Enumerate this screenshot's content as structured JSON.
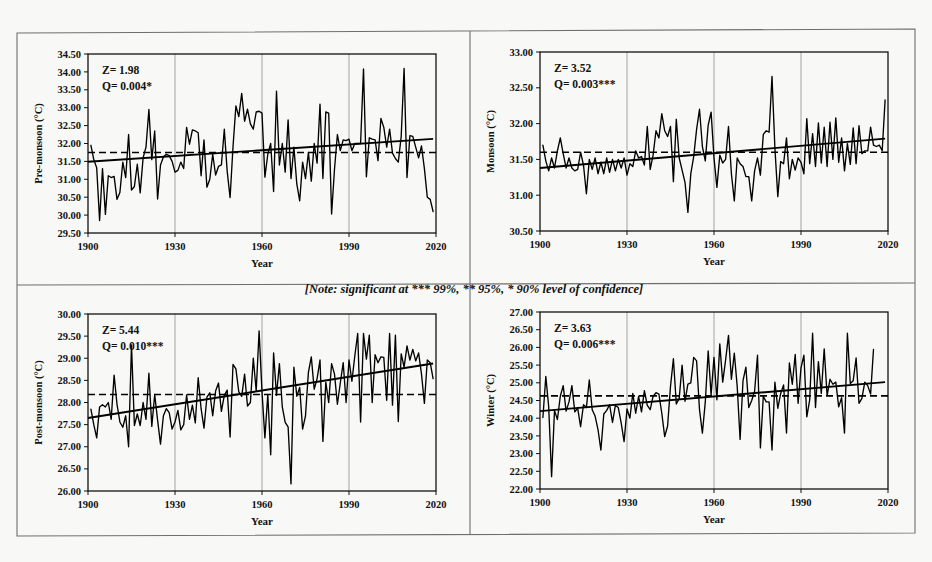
{
  "figure": {
    "note": "[Note: significant at *** 99%, ** 95%, * 90% level of confidence]",
    "background_color": "#f8f8f6",
    "line_color": "#000000",
    "grid_color": "#9a9a9a"
  },
  "chart_data": [
    {
      "id": "pre-monsoon",
      "type": "line",
      "title": "",
      "xlabel": "Year",
      "ylabel": "Pre-monsoon (°C)",
      "xlim": [
        1900,
        2020
      ],
      "ylim": [
        29.5,
        34.5
      ],
      "ytick_step": 0.5,
      "xticks": [
        1900,
        1930,
        1960,
        1990,
        2020
      ],
      "yticks": [
        "34.50",
        "34.00",
        "33.50",
        "33.00",
        "32.50",
        "32.00",
        "31.50",
        "31.00",
        "30.50",
        "30.00",
        "29.50"
      ],
      "grid": "vertical",
      "annotations": {
        "z": "Z= 1.98",
        "q": "Q= 0.004*"
      },
      "mean": 31.75,
      "trend": {
        "start_year": 1900,
        "start_value": 31.49,
        "end_year": 2019,
        "end_value": 32.13
      },
      "x_start": 1901,
      "values": [
        31.95,
        31.55,
        31.32,
        29.85,
        31.3,
        30.02,
        31.1,
        31.05,
        31.08,
        30.44,
        30.63,
        31.48,
        31.05,
        32.25,
        30.7,
        30.8,
        31.42,
        30.62,
        31.6,
        31.9,
        32.95,
        31.55,
        32.35,
        30.45,
        31.4,
        31.62,
        31.7,
        31.66,
        31.5,
        31.2,
        31.25,
        31.48,
        31.3,
        32.45,
        31.98,
        32.38,
        32.35,
        32.3,
        31.1,
        32.1,
        30.78,
        31.0,
        31.7,
        31.12,
        31.36,
        31.4,
        32.4,
        31.22,
        30.49,
        31.9,
        33.05,
        32.75,
        33.4,
        32.62,
        32.96,
        32.55,
        32.4,
        32.88,
        32.9,
        32.85,
        31.06,
        31.7,
        32.0,
        30.66,
        33.46,
        31.4,
        32.0,
        31.2,
        32.66,
        31.02,
        31.9,
        30.87,
        30.4,
        31.48,
        31.02,
        31.75,
        30.95,
        32.0,
        31.45,
        33.1,
        31.02,
        32.88,
        32.85,
        30.03,
        31.28,
        32.25,
        31.8,
        32.1,
        32.08,
        32.12,
        31.8,
        32.0,
        32.0,
        32.0,
        34.08,
        31.07,
        32.16,
        32.12,
        32.1,
        31.52,
        32.7,
        32.45,
        31.9,
        32.4,
        31.73,
        31.58,
        31.48,
        32.2,
        34.1,
        31.05,
        32.22,
        32.2,
        31.9,
        31.6,
        31.93,
        31.3,
        30.5,
        30.44,
        30.1
      ]
    },
    {
      "id": "monsoon",
      "type": "line",
      "title": "",
      "xlabel": "Year",
      "ylabel": "Monsoon (°C)",
      "xlim": [
        1900,
        2020
      ],
      "ylim": [
        30.5,
        33.0
      ],
      "ytick_step": 0.5,
      "xticks": [
        1900,
        1930,
        1960,
        1990,
        2020
      ],
      "yticks": [
        "33.00",
        "32.50",
        "32.00",
        "31.50",
        "31.00",
        "30.50"
      ],
      "grid": "vertical",
      "annotations": {
        "z": "Z= 3.52",
        "q": "Q= 0.003***"
      },
      "mean": 31.6,
      "trend": {
        "start_year": 1900,
        "start_value": 31.38,
        "end_year": 2019,
        "end_value": 31.79
      },
      "x_start": 1901,
      "values": [
        31.7,
        31.48,
        31.34,
        31.52,
        31.38,
        31.62,
        31.8,
        31.58,
        31.38,
        31.52,
        31.38,
        31.34,
        31.36,
        31.6,
        31.42,
        31.02,
        31.5,
        31.36,
        31.52,
        31.3,
        31.46,
        31.3,
        31.52,
        31.32,
        31.5,
        31.34,
        31.5,
        31.38,
        31.52,
        31.28,
        31.44,
        31.4,
        31.62,
        31.52,
        31.54,
        31.42,
        31.96,
        31.36,
        31.56,
        31.9,
        31.8,
        32.14,
        31.9,
        31.82,
        31.96,
        31.19,
        32.06,
        31.52,
        31.35,
        31.18,
        30.76,
        31.3,
        31.54,
        31.92,
        32.2,
        31.68,
        31.48,
        31.98,
        32.16,
        31.52,
        31.11,
        31.56,
        31.45,
        31.5,
        31.96,
        31.3,
        30.92,
        31.52,
        31.44,
        31.4,
        31.26,
        31.26,
        30.92,
        31.34,
        31.52,
        31.28,
        31.85,
        31.9,
        31.88,
        32.66,
        31.66,
        30.98,
        31.47,
        31.44,
        31.8,
        31.23,
        31.5,
        31.35,
        31.52,
        31.46,
        31.3,
        32.07,
        31.44,
        31.86,
        31.4,
        32.01,
        31.45,
        31.95,
        31.4,
        32.02,
        31.5,
        32.08,
        31.46,
        31.8,
        31.34,
        31.72,
        31.43,
        31.94,
        31.44,
        31.97,
        31.58,
        31.62,
        31.62,
        31.95,
        31.7,
        31.68,
        31.7,
        31.62,
        32.33
      ]
    },
    {
      "id": "post-monsoon",
      "type": "line",
      "title": "",
      "xlabel": "Year",
      "ylabel": "Post-monsoon (°C)",
      "xlim": [
        1900,
        2020
      ],
      "ylim": [
        26.0,
        30.0
      ],
      "ytick_step": 0.5,
      "xticks": [
        1900,
        1930,
        1960,
        1990,
        2020
      ],
      "yticks": [
        "30.00",
        "29.50",
        "29.00",
        "28.50",
        "28.00",
        "27.50",
        "27.00",
        "26.50",
        "26.00"
      ],
      "grid": "vertical",
      "annotations": {
        "z": "Z= 5.44",
        "q": "Q= 0.010***"
      },
      "mean": 28.18,
      "trend": {
        "start_year": 1900,
        "start_value": 27.65,
        "end_year": 2019,
        "end_value": 28.88
      },
      "x_start": 1901,
      "values": [
        27.85,
        27.5,
        27.2,
        27.9,
        27.95,
        27.9,
        28.0,
        27.62,
        28.62,
        27.96,
        27.56,
        27.44,
        27.7,
        27.0,
        29.3,
        27.48,
        27.74,
        27.48,
        28.0,
        27.62,
        28.66,
        27.46,
        28.18,
        27.6,
        27.06,
        27.7,
        27.86,
        27.77,
        27.4,
        27.56,
        27.82,
        27.38,
        27.5,
        28.17,
        27.62,
        27.94,
        27.54,
        28.56,
        27.86,
        27.42,
        28.12,
        28.22,
        27.7,
        28.26,
        28.44,
        27.8,
        28.16,
        28.28,
        27.22,
        28.86,
        28.76,
        28.24,
        28.14,
        28.64,
        27.92,
        28.0,
        29.0,
        28.26,
        29.62,
        28.24,
        27.2,
        28.18,
        26.82,
        29.12,
        28.16,
        28.88,
        27.9,
        27.55,
        27.45,
        26.16,
        28.8,
        28.14,
        28.34,
        27.4,
        27.7,
        28.68,
        29.03,
        28.3,
        28.54,
        28.96,
        27.12,
        28.46,
        28.0,
        28.88,
        28.64,
        27.96,
        28.44,
        28.9,
        28.0,
        28.96,
        28.48,
        29.05,
        29.56,
        27.56,
        29.56,
        28.98,
        29.52,
        28.0,
        29.08,
        28.9,
        29.03,
        29.02,
        28.05,
        29.56,
        27.94,
        29.52,
        27.57,
        29.1,
        28.8,
        29.28,
        28.96,
        29.2,
        28.94,
        29.12,
        28.64,
        27.98,
        28.96,
        28.9,
        28.54
      ]
    },
    {
      "id": "winter",
      "type": "line",
      "title": "",
      "xlabel": "Year",
      "ylabel": "Winter (°C)",
      "xlim": [
        1900,
        2020
      ],
      "ylim": [
        22.0,
        27.0
      ],
      "ytick_step": 0.5,
      "xticks": [
        1900,
        1930,
        1960,
        1990,
        2020
      ],
      "yticks": [
        "27.00",
        "26.50",
        "26.00",
        "25.50",
        "25.00",
        "24.50",
        "24.00",
        "23.50",
        "23.00",
        "22.50",
        "22.00"
      ],
      "grid": "vertical",
      "annotations": {
        "z": "Z= 3.63",
        "q": "Q= 0.006***"
      },
      "mean": 24.63,
      "trend": {
        "start_year": 1900,
        "start_value": 24.2,
        "end_year": 2019,
        "end_value": 25.02
      },
      "x_start": 1901,
      "values": [
        24.02,
        25.18,
        24.32,
        22.35,
        24.22,
        23.96,
        24.62,
        24.92,
        24.2,
        24.46,
        24.92,
        24.18,
        24.28,
        23.76,
        24.38,
        24.3,
        25.08,
        24.24,
        24.06,
        23.68,
        23.1,
        24.12,
        24.22,
        24.38,
        23.88,
        24.36,
        24.3,
        23.86,
        23.34,
        24.26,
        24.0,
        24.7,
        24.14,
        24.62,
        24.18,
        24.78,
        24.36,
        24.24,
        24.62,
        24.72,
        24.68,
        24.14,
        23.48,
        23.78,
        24.9,
        25.68,
        24.4,
        24.56,
        25.5,
        24.48,
        24.96,
        25.0,
        25.72,
        25.62,
        24.24,
        23.58,
        24.46,
        25.9,
        24.66,
        25.72,
        24.52,
        26.1,
        25.02,
        25.64,
        26.34,
        25.1,
        25.84,
        24.9,
        23.4,
        25.06,
        25.44,
        24.3,
        24.5,
        24.76,
        25.78,
        23.16,
        24.62,
        24.46,
        24.46,
        23.1,
        25.02,
        24.28,
        24.7,
        24.94,
        23.58,
        25.56,
        24.96,
        25.8,
        24.42,
        25.42,
        25.78,
        24.04,
        24.52,
        26.4,
        24.3,
        25.6,
        24.7,
        25.96,
        24.64,
        25.1,
        24.96,
        25.02,
        24.32,
        24.58,
        23.58,
        26.4,
        24.98,
        25.06,
        25.7,
        24.42,
        24.56,
        25.02,
        24.92,
        24.68,
        25.94
      ]
    }
  ]
}
